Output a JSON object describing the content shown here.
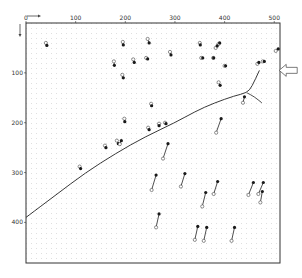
{
  "figure": {
    "type": "displacement-vector-diagram",
    "x_axis": {
      "ticks": [
        {
          "value": 0,
          "label": "0"
        },
        {
          "value": 100,
          "label": "100"
        },
        {
          "value": 200,
          "label": "200"
        },
        {
          "value": 300,
          "label": "300"
        },
        {
          "value": 400,
          "label": "400"
        },
        {
          "value": 500,
          "label": "500"
        }
      ],
      "range": [
        0,
        515
      ],
      "direction": "right"
    },
    "y_axis": {
      "ticks": [
        {
          "value": 100,
          "label": "100"
        },
        {
          "value": 200,
          "label": "200"
        },
        {
          "value": 300,
          "label": "300"
        },
        {
          "value": 400,
          "label": "400"
        }
      ],
      "range": [
        0,
        485
      ],
      "direction": "down"
    },
    "grid": true,
    "arrow_indicator": {
      "x": 510,
      "y": 95,
      "direction": "left"
    },
    "colors": {
      "frame": "#333333",
      "grid": "#bdbdbd",
      "curve": "#222222",
      "marker_filled": "#1a1a1a",
      "marker_open": "#ffffff"
    }
  },
  "chart_data": {
    "type": "scatter",
    "title": "",
    "xlabel": "",
    "ylabel": "",
    "xlim": [
      0,
      515
    ],
    "ylim": [
      485,
      0
    ],
    "grid": true,
    "vectors": [
      {
        "start": [
          40,
          40
        ],
        "end": [
          42,
          45
        ]
      },
      {
        "start": [
          195,
          38
        ],
        "end": [
          196,
          44
        ]
      },
      {
        "start": [
          245,
          32
        ],
        "end": [
          248,
          40
        ]
      },
      {
        "start": [
          177,
          77
        ],
        "end": [
          178,
          85
        ]
      },
      {
        "start": [
          216,
          73
        ],
        "end": [
          218,
          79
        ]
      },
      {
        "start": [
          290,
          58
        ],
        "end": [
          292,
          64
        ]
      },
      {
        "start": [
          350,
          40
        ],
        "end": [
          351,
          44
        ]
      },
      {
        "start": [
          388,
          42
        ],
        "end": [
          390,
          40
        ]
      },
      {
        "start": [
          382,
          50
        ],
        "end": [
          385,
          46
        ]
      },
      {
        "start": [
          242,
          70
        ],
        "end": [
          245,
          72
        ]
      },
      {
        "start": [
          194,
          104
        ],
        "end": [
          196,
          110
        ]
      },
      {
        "start": [
          353,
          70
        ],
        "end": [
          356,
          70
        ]
      },
      {
        "start": [
          400,
          86
        ],
        "end": [
          402,
          86
        ]
      },
      {
        "start": [
          377,
          70
        ],
        "end": [
          378,
          70
        ]
      },
      {
        "start": [
          466,
          82
        ],
        "end": [
          469,
          79
        ]
      },
      {
        "start": [
          477,
          77
        ],
        "end": [
          480,
          77
        ]
      },
      {
        "start": [
          503,
          56
        ],
        "end": [
          508,
          52
        ]
      },
      {
        "start": [
          388,
          119
        ],
        "end": [
          391,
          125
        ]
      },
      {
        "start": [
          198,
          192
        ],
        "end": [
          199,
          198
        ]
      },
      {
        "start": [
          246,
          210
        ],
        "end": [
          248,
          214
        ]
      },
      {
        "start": [
          280,
          200
        ],
        "end": [
          282,
          202
        ]
      },
      {
        "start": [
          268,
          202
        ],
        "end": [
          268,
          206
        ]
      },
      {
        "start": [
          252,
          162
        ],
        "end": [
          253,
          166
        ]
      },
      {
        "start": [
          108,
          288
        ],
        "end": [
          110,
          292
        ]
      },
      {
        "start": [
          159,
          246
        ],
        "end": [
          161,
          250
        ]
      },
      {
        "start": [
          183,
          236
        ],
        "end": [
          186,
          242
        ]
      },
      {
        "start": [
          189,
          243
        ],
        "end": [
          192,
          236
        ]
      },
      {
        "start": [
          437,
          160
        ],
        "end": [
          440,
          148
        ]
      },
      {
        "start": [
          276,
          272
        ],
        "end": [
          286,
          242
        ]
      },
      {
        "start": [
          383,
          220
        ],
        "end": [
          393,
          192
        ]
      },
      {
        "start": [
          253,
          335
        ],
        "end": [
          262,
          305
        ]
      },
      {
        "start": [
          312,
          328
        ],
        "end": [
          320,
          302
        ]
      },
      {
        "start": [
          355,
          368
        ],
        "end": [
          362,
          340
        ]
      },
      {
        "start": [
          378,
          343
        ],
        "end": [
          386,
          318
        ]
      },
      {
        "start": [
          448,
          345
        ],
        "end": [
          458,
          320
        ]
      },
      {
        "start": [
          468,
          343
        ],
        "end": [
          478,
          320
        ]
      },
      {
        "start": [
          472,
          360
        ],
        "end": [
          476,
          338
        ]
      },
      {
        "start": [
          262,
          410
        ],
        "end": [
          268,
          383
        ]
      },
      {
        "start": [
          340,
          435
        ],
        "end": [
          346,
          408
        ]
      },
      {
        "start": [
          358,
          437
        ],
        "end": [
          364,
          410
        ]
      },
      {
        "start": [
          414,
          437
        ],
        "end": [
          420,
          410
        ]
      }
    ],
    "curve": {
      "name": "crack-boundary",
      "points": [
        [
          0,
          390
        ],
        [
          60,
          345
        ],
        [
          120,
          300
        ],
        [
          180,
          262
        ],
        [
          240,
          228
        ],
        [
          300,
          200
        ],
        [
          340,
          178
        ],
        [
          380,
          160
        ],
        [
          420,
          146
        ],
        [
          445,
          140
        ],
        [
          455,
          128
        ],
        [
          470,
          95
        ]
      ],
      "branch": [
        [
          445,
          140
        ],
        [
          460,
          148
        ],
        [
          475,
          160
        ]
      ]
    }
  }
}
